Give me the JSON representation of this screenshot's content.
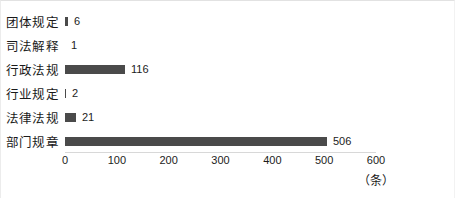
{
  "chart_data": {
    "type": "bar",
    "orientation": "horizontal",
    "title": "",
    "xlabel": "（条）",
    "ylabel": "",
    "xlim": [
      0,
      600
    ],
    "xticks": [
      0,
      100,
      200,
      300,
      400,
      500,
      600
    ],
    "xtick_labels": [
      "0",
      "100",
      "200",
      "300",
      "400",
      "500",
      "600"
    ],
    "grid": false,
    "legend": false,
    "bar_color": "#4a4a4a",
    "background_color": "#ffffff",
    "categories": [
      "团体规定",
      "司法解释",
      "行政法规",
      "行业规定",
      "法律法规",
      "部门规章"
    ],
    "values": [
      6,
      1,
      116,
      2,
      21,
      506
    ],
    "value_labels": [
      "6",
      "1",
      "116",
      "2",
      "21",
      "506"
    ],
    "unit": "条"
  },
  "axis": {
    "unit_label": "（条）"
  }
}
